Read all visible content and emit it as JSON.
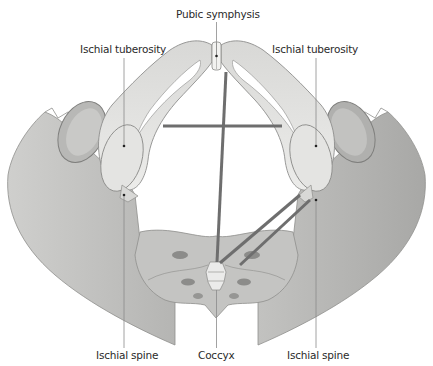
{
  "diagram": {
    "colors": {
      "bone_light": "#e6e6e4",
      "bone_mid": "#c9c9c7",
      "bone_dark": "#a9a9a7",
      "ilium": "#bdbdbb",
      "measure_line": "#6e6e6e",
      "leader_line": "#8a8a8a",
      "label_text": "#2a2a2a"
    },
    "labels": {
      "pubic_symphysis": "Pubic symphysis",
      "ischial_tuberosity_left": "Ischial tuberosity",
      "ischial_tuberosity_right": "Ischial tuberosity",
      "ischial_spine_left": "Ischial spine",
      "coccyx": "Coccyx",
      "ischial_spine_right": "Ischial spine"
    },
    "measurements": [
      {
        "name": "transverse-diameter",
        "from": "left ischial tuberosity",
        "to": "right ischial tuberosity"
      },
      {
        "name": "anteroposterior-diameter",
        "from": "pubic symphysis",
        "to": "coccyx"
      },
      {
        "name": "posterior-sagittal-lines",
        "from": "right ischial spine",
        "to": "coccyx"
      }
    ]
  }
}
